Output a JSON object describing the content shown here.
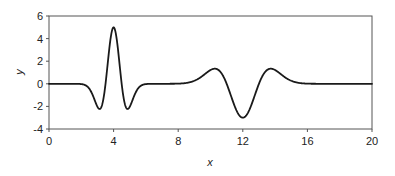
{
  "chart_data": {
    "type": "line",
    "title": "",
    "xlabel": "x",
    "ylabel": "y",
    "xlim": [
      0,
      20
    ],
    "ylim": [
      -4,
      6
    ],
    "xticks": [
      0,
      4,
      8,
      12,
      16,
      20
    ],
    "yticks": [
      -4,
      -2,
      0,
      2,
      4,
      6
    ],
    "grid": false,
    "legend": null,
    "line_color": "#1a1a1a",
    "series": [
      {
        "name": "y",
        "description": "Sum of two Mexican-hat (Ricker) wavelets: positive narrow pulse at x=4 (amplitude 5, sigma 0.5) and negative wider pulse at x=12 (amplitude -3, sigma 1)",
        "components": [
          {
            "center": 4,
            "amplitude": 5,
            "sigma": 0.5
          },
          {
            "center": 12,
            "amplitude": -3,
            "sigma": 1.0
          }
        ],
        "x": [
          0,
          2,
          2.5,
          3.13,
          3.5,
          4,
          4.5,
          4.87,
          5.5,
          6,
          8,
          9,
          10.27,
          11,
          12,
          13,
          13.73,
          15,
          16,
          20
        ],
        "values": [
          0,
          -0.0,
          -0.07,
          -2.23,
          -0.43,
          5.0,
          -0.43,
          -2.23,
          -0.07,
          -0.0,
          -0.0,
          -0.09,
          1.34,
          0.0,
          -3.0,
          0.0,
          1.34,
          0.09,
          0.02,
          0
        ]
      }
    ]
  }
}
